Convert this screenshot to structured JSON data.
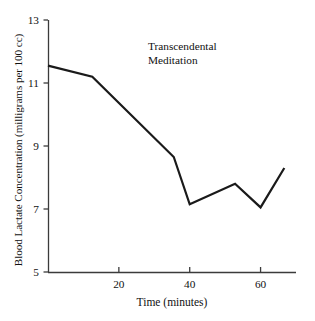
{
  "chart_data": {
    "type": "line",
    "title": "",
    "annotation": [
      "Transcendental",
      "Meditation"
    ],
    "xlabel": "Time (minutes)",
    "ylabel": "Blood Lactate Concentration (milligrams per 100 cc)",
    "xlim": [
      0,
      70
    ],
    "ylim": [
      5,
      13
    ],
    "xticks": [
      20,
      40,
      60
    ],
    "xtick_labels": [
      "20",
      "40",
      "60"
    ],
    "yticks": [
      5,
      7,
      9,
      11,
      13
    ],
    "ytick_labels": [
      "5",
      "7",
      "9",
      "11",
      "13"
    ],
    "grid": false,
    "legend": "none",
    "line_color": "#1a1a1a",
    "line_width": 2.2,
    "axis_color": "#3b3b3b",
    "background": "#ffffff",
    "series": [
      {
        "name": "Transcendental Meditation",
        "x": [
          0,
          12.5,
          35.5,
          40.0,
          52.8,
          60.0,
          66.7
        ],
        "y": [
          11.55,
          11.2,
          8.65,
          7.15,
          7.8,
          7.05,
          8.3
        ]
      }
    ]
  },
  "axes": {
    "x_axis_name": "time-axis",
    "y_axis_name": "blood-lactate-axis"
  }
}
